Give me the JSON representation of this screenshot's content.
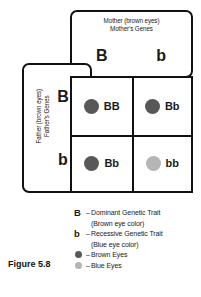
{
  "figure": {
    "caption": "Figure 5.8"
  },
  "mother": {
    "title_line1": "Mother (brown eyes)",
    "title_line2": "Mother's Genes",
    "genes": [
      "B",
      "b"
    ]
  },
  "father": {
    "title_line1": "Father (brown eyes)",
    "title_line2": "Father's Genes",
    "genes": [
      "B",
      "b"
    ]
  },
  "punnett": {
    "cells": [
      {
        "genotype": "BB",
        "eye_color_name": "brown",
        "dot_color": "#585858"
      },
      {
        "genotype": "Bb",
        "eye_color_name": "brown",
        "dot_color": "#585858"
      },
      {
        "genotype": "Bb",
        "eye_color_name": "brown",
        "dot_color": "#585858"
      },
      {
        "genotype": "bb",
        "eye_color_name": "blue",
        "dot_color": "#b5b5b5"
      }
    ]
  },
  "legend": {
    "items": [
      {
        "key": "B",
        "key_type": "letter",
        "dash": "–",
        "text": "Dominant Genetic Trait",
        "subtext": "(Brown eye color)"
      },
      {
        "key": "b",
        "key_type": "letter",
        "dash": "–",
        "text": "Recessive Genetic Trait",
        "subtext": "(Blue eye color)"
      },
      {
        "key": "brown-dot",
        "key_type": "dot",
        "dot_color": "#585858",
        "dash": "–",
        "text": "Brown Eyes",
        "subtext": ""
      },
      {
        "key": "blue-dot",
        "key_type": "dot",
        "dot_color": "#b5b5b5",
        "dash": "–",
        "text": "Blue Eyes",
        "subtext": ""
      }
    ]
  },
  "colors": {
    "line": "#111111",
    "brown_eye": "#585858",
    "blue_eye": "#b5b5b5",
    "background": "#ffffff"
  }
}
